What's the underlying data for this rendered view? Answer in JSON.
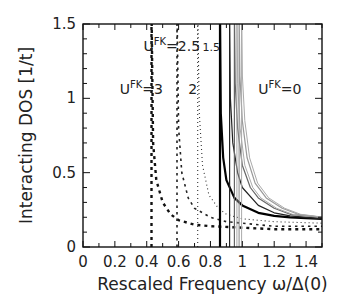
{
  "chart_data": {
    "type": "line",
    "title": "",
    "xlabel": "Rescaled Frequency ω/Δ(0)",
    "ylabel": "Interacting DOS [1/t]",
    "xlim": [
      0,
      1.5
    ],
    "ylim": [
      0,
      1.5
    ],
    "xticks": [
      "0",
      "0.2",
      "0.4",
      "0.6",
      "0.8",
      "1",
      "1.2",
      "1.4"
    ],
    "yticks": [
      "0",
      "0.5",
      "1",
      "1.5"
    ],
    "grid": false,
    "legend": "inline annotations",
    "annotations": [
      {
        "text": "U",
        "sup": "FK",
        "suffix": "=3",
        "x": 0.23,
        "y": 1.03
      },
      {
        "text": "U",
        "sup": "FK",
        "suffix": "=2.5",
        "x": 0.38,
        "y": 1.32
      },
      {
        "text": "2",
        "x": 0.66,
        "y": 1.03
      },
      {
        "text": "1.5",
        "x": 0.75,
        "y": 1.32
      },
      {
        "text": "U",
        "sup": "FK",
        "suffix": "=0",
        "x": 1.1,
        "y": 1.03
      }
    ],
    "series": [
      {
        "name": "U^FK=3",
        "style": "dashed-thick",
        "color": "#111111",
        "onset": 0.43,
        "x": [
          0.43,
          0.44,
          0.46,
          0.5,
          0.55,
          0.6,
          0.7,
          0.8,
          1.0,
          1.2,
          1.5
        ],
        "y": [
          1.18,
          0.7,
          0.45,
          0.3,
          0.22,
          0.18,
          0.15,
          0.14,
          0.13,
          0.12,
          0.12
        ]
      },
      {
        "name": "U^FK=2.5",
        "style": "dashed",
        "color": "#222222",
        "onset": 0.59,
        "x": [
          0.59,
          0.6,
          0.62,
          0.66,
          0.7,
          0.8,
          0.9,
          1.0,
          1.2,
          1.5
        ],
        "y": [
          1.35,
          0.8,
          0.5,
          0.33,
          0.26,
          0.2,
          0.17,
          0.16,
          0.14,
          0.14
        ]
      },
      {
        "name": "U^FK=2",
        "style": "dotted",
        "color": "#333333",
        "onset": 0.72,
        "x": [
          0.72,
          0.73,
          0.75,
          0.79,
          0.85,
          0.9,
          1.0,
          1.2,
          1.5
        ],
        "y": [
          1.5,
          0.9,
          0.55,
          0.35,
          0.26,
          0.22,
          0.19,
          0.17,
          0.16
        ]
      },
      {
        "name": "U^FK=1.5",
        "style": "solid-thick",
        "color": "#000000",
        "onset": 0.86,
        "x": [
          0.86,
          0.865,
          0.88,
          0.9,
          0.95,
          1.0,
          1.1,
          1.2,
          1.3,
          1.5
        ],
        "y": [
          1.5,
          0.9,
          0.6,
          0.45,
          0.33,
          0.28,
          0.23,
          0.21,
          0.2,
          0.19
        ]
      },
      {
        "name": "U^FK=1",
        "style": "solid",
        "color": "#222222",
        "onset": 0.92,
        "x": [
          0.92,
          0.925,
          0.94,
          0.97,
          1.0,
          1.1,
          1.2,
          1.3,
          1.5
        ],
        "y": [
          1.5,
          1.0,
          0.7,
          0.5,
          0.4,
          0.28,
          0.23,
          0.21,
          0.19
        ]
      },
      {
        "name": "U^FK=0.5",
        "style": "solid",
        "color": "#666666",
        "onset": 0.95,
        "x": [
          0.95,
          0.955,
          0.97,
          1.0,
          1.05,
          1.1,
          1.2,
          1.3,
          1.5
        ],
        "y": [
          1.5,
          1.1,
          0.8,
          0.55,
          0.4,
          0.33,
          0.26,
          0.22,
          0.2
        ]
      },
      {
        "name": "U^FK=0",
        "style": "solid",
        "color": "#999999",
        "onset": 0.98,
        "x": [
          0.98,
          0.985,
          1.0,
          1.03,
          1.08,
          1.15,
          1.25,
          1.35,
          1.5
        ],
        "y": [
          1.5,
          1.15,
          0.85,
          0.6,
          0.43,
          0.33,
          0.26,
          0.22,
          0.2
        ]
      }
    ]
  }
}
